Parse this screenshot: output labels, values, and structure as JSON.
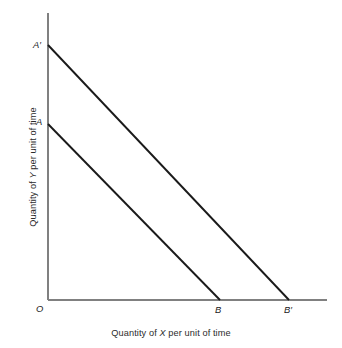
{
  "figure": {
    "background_color": "#ffffff",
    "axis_color": "#808080",
    "line_color": "#1a1a1a",
    "axis_titles": {
      "x_prefix": "Quantity of ",
      "x_variable": "X",
      "x_suffix": " per unit of time",
      "x_full": "Quantity of X per unit of time",
      "y_prefix": "Quantity of ",
      "y_variable": "Y",
      "y_suffix": " per unit of time",
      "y_full": "Quantity of Y per unit of time"
    },
    "point_labels": {
      "origin": "O",
      "a": "A",
      "a_prime": "A′",
      "b": "B",
      "b_prime": "B′"
    }
  },
  "chart_data": {
    "type": "line",
    "title": "",
    "xlabel": "Quantity of X per unit of time",
    "ylabel": "Quantity of Y per unit of time",
    "xlim": [
      0,
      100
    ],
    "ylim": [
      0,
      100
    ],
    "grid": false,
    "legend": "none",
    "axes_pixels": {
      "origin_x": 48,
      "origin_y": 300,
      "y_axis_top": 13,
      "x_axis_right": 327
    },
    "series": [
      {
        "name": "Budget line AB",
        "endpoints_label": [
          "A",
          "B"
        ],
        "points_pixels": [
          [
            48,
            124
          ],
          [
            220,
            300
          ]
        ],
        "y_intercept_label": "A",
        "x_intercept_label": "B"
      },
      {
        "name": "Budget line A'B'",
        "endpoints_label": [
          "A′",
          "B′"
        ],
        "points_pixels": [
          [
            48,
            45
          ],
          [
            289,
            300
          ]
        ],
        "y_intercept_label": "A′",
        "x_intercept_label": "B′"
      }
    ],
    "annotations": [
      {
        "text": "O",
        "role": "origin-label",
        "position_pixels": [
          36,
          304
        ]
      },
      {
        "text": "A",
        "role": "y-intercept-inner",
        "position_pixels": [
          36,
          117
        ]
      },
      {
        "text": "A′",
        "role": "y-intercept-outer",
        "position_pixels": [
          33,
          40
        ]
      },
      {
        "text": "B",
        "role": "x-intercept-inner",
        "position_pixels": [
          215,
          305
        ]
      },
      {
        "text": "B′",
        "role": "x-intercept-outer",
        "position_pixels": [
          284,
          305
        ]
      }
    ]
  }
}
